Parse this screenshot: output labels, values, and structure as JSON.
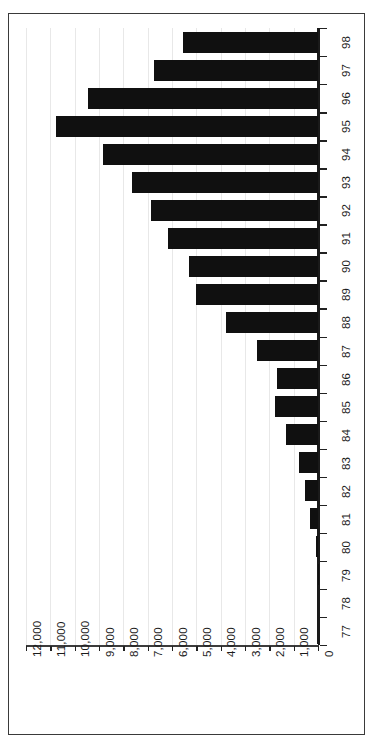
{
  "chart_data": {
    "type": "bar",
    "orientation": "rotated-vertical",
    "title": "",
    "subtitle": "",
    "xlabel": "",
    "ylabel": "",
    "categories": [
      "77",
      "78",
      "79",
      "80",
      "81",
      "82",
      "83",
      "84",
      "85",
      "86",
      "87",
      "88",
      "89",
      "90",
      "91",
      "92",
      "93",
      "94",
      "95",
      "96",
      "97",
      "98"
    ],
    "values": [
      0,
      5,
      20,
      80,
      320,
      520,
      800,
      1300,
      1750,
      1700,
      2500,
      3800,
      5000,
      5300,
      6150,
      6850,
      7650,
      8850,
      10750,
      9450,
      6750,
      5550
    ],
    "value_axis": {
      "min": 0,
      "max": 12000,
      "tick_step": 1000,
      "tick_labels": [
        "12,000",
        "11,000",
        "10,000",
        "9,000",
        "8,000",
        "7,000",
        "6,000",
        "5,000",
        "4,000",
        "3,000",
        "2,000",
        "1,000",
        "0"
      ],
      "tick_values": [
        12000,
        11000,
        10000,
        9000,
        8000,
        7000,
        6000,
        5000,
        4000,
        3000,
        2000,
        1000,
        0
      ]
    },
    "category_axis": {
      "labels_top_to_bottom": [
        "98",
        "97",
        "96",
        "95",
        "94",
        "93",
        "92",
        "91",
        "90",
        "89",
        "88",
        "87",
        "86",
        "85",
        "84",
        "83",
        "82",
        "81",
        "80",
        "79",
        "78",
        "77"
      ]
    },
    "grid": true,
    "legend": false,
    "legend_entries": [],
    "bar_color": "#101010",
    "grid_color": "#e8e8e8",
    "axis_color": "#1a1a1a",
    "frame_color": "#3a3a3a",
    "background": "#ffffff"
  }
}
